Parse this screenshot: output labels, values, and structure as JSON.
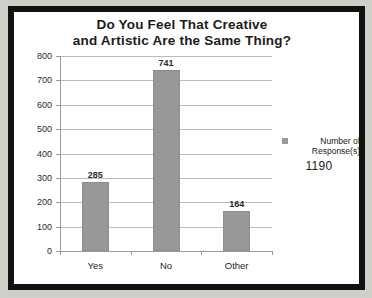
{
  "chart_data": {
    "type": "bar",
    "title": "Do You Feel That Creative and Artistic Are the Same Thing?",
    "title_lines": [
      "Do You Feel That Creative",
      "and Artistic Are the Same Thing?"
    ],
    "categories": [
      "Yes",
      "No",
      "Other"
    ],
    "values": [
      285,
      741,
      164
    ],
    "value_labels": [
      "285",
      "741",
      "164"
    ],
    "series": [
      {
        "name": "Number of Response(s)",
        "values": [
          285,
          741,
          164
        ]
      }
    ],
    "xlabel": "",
    "ylabel": "",
    "ylim": [
      0,
      800
    ],
    "ytick_step": 100,
    "ytick_labels": [
      "800",
      "700",
      "600",
      "500",
      "400",
      "300",
      "200",
      "100",
      "0"
    ],
    "ytick_values": [
      800,
      700,
      600,
      500,
      400,
      300,
      200,
      100,
      0
    ],
    "grid": true,
    "grid_orientation": "horizontal",
    "legend_position": "right",
    "legend": {
      "swatch_color": "#9a9a9a",
      "label_lines": [
        "Number of",
        "Response(s)"
      ],
      "label": "Number of Response(s)",
      "total": "1190"
    },
    "colors": {
      "bar": "#989898",
      "bar_border": "#8e8e8e",
      "gridline": "#bdbdbd",
      "axis": "#9a9a9a",
      "text": "#1c1c1c",
      "background": "#ffffff",
      "frame": "#111111"
    }
  }
}
